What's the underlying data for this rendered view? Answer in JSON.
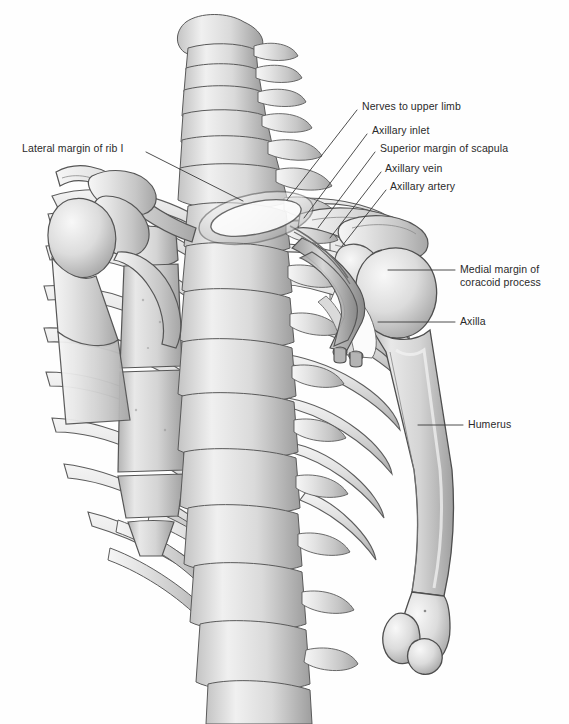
{
  "figure": {
    "background_color": "#fefefe",
    "bone_fill": "#dcdcdc",
    "bone_fill_light": "#efefef",
    "bone_fill_dark": "#b4b4b4",
    "outline_color": "#4a4a4a",
    "label_color": "#2a2a2a",
    "leader_color": "#3a3a3a"
  },
  "labels": [
    {
      "id": "lateral-margin-rib-1",
      "text": "Lateral margin of rib I",
      "side": "left",
      "text_x": 22,
      "text_y": 142,
      "leader": [
        [
          146,
          152
        ],
        [
          243,
          201
        ]
      ]
    },
    {
      "id": "nerves-to-upper-limb",
      "text": "Nerves to upper limb",
      "side": "right",
      "text_x": 362,
      "text_y": 100,
      "leader": [
        [
          357,
          110
        ],
        [
          287,
          200
        ]
      ]
    },
    {
      "id": "axillary-inlet",
      "text": "Axillary inlet",
      "side": "right",
      "text_x": 372,
      "text_y": 124,
      "leader": [
        [
          367,
          134
        ],
        [
          304,
          218
        ]
      ]
    },
    {
      "id": "superior-margin-of-scapula",
      "text": "Superior margin of scapula",
      "side": "right",
      "text_x": 380,
      "text_y": 142,
      "leader": [
        [
          375,
          152
        ],
        [
          318,
          228
        ]
      ]
    },
    {
      "id": "axillary-vein",
      "text": "Axillary vein",
      "side": "right",
      "text_x": 385,
      "text_y": 162,
      "leader": [
        [
          381,
          172
        ],
        [
          330,
          238
        ]
      ]
    },
    {
      "id": "axillary-artery",
      "text": "Axillary artery",
      "side": "right",
      "text_x": 390,
      "text_y": 180,
      "leader": [
        [
          386,
          190
        ],
        [
          342,
          246
        ]
      ]
    },
    {
      "id": "medial-margin-of-coracoid-process",
      "text": "Medial margin of\ncoracoid process",
      "side": "right",
      "text_x": 460,
      "text_y": 263,
      "leader": [
        [
          455,
          270
        ],
        [
          388,
          270
        ]
      ]
    },
    {
      "id": "axilla",
      "text": "Axilla",
      "side": "right",
      "text_x": 460,
      "text_y": 315,
      "leader": [
        [
          455,
          322
        ],
        [
          378,
          322
        ]
      ]
    },
    {
      "id": "humerus",
      "text": "Humerus",
      "side": "right",
      "text_x": 468,
      "text_y": 418,
      "leader": [
        [
          463,
          425
        ],
        [
          418,
          425
        ]
      ]
    }
  ],
  "structures": [
    {
      "id": "cervical-spine",
      "name": "Cervical vertebrae",
      "count": 7
    },
    {
      "id": "thoracic-spine",
      "name": "Thoracic vertebrae",
      "count": 9
    },
    {
      "id": "rib-cage-left",
      "name": "Left ribs",
      "count": 9
    },
    {
      "id": "rib-cage-right",
      "name": "Right ribs",
      "count": 9
    },
    {
      "id": "sternum",
      "name": "Sternum"
    },
    {
      "id": "xiphoid-process",
      "name": "Xiphoid process"
    },
    {
      "id": "clavicle-left",
      "name": "Left clavicle"
    },
    {
      "id": "clavicle-right",
      "name": "Right clavicle"
    },
    {
      "id": "scapula-left",
      "name": "Left scapula"
    },
    {
      "id": "scapula-right",
      "name": "Right scapula"
    },
    {
      "id": "humerus-left",
      "name": "Left humerus (partial)"
    },
    {
      "id": "humerus-right",
      "name": "Right humerus"
    },
    {
      "id": "axillary-vessels",
      "name": "Axillary vessels"
    }
  ]
}
